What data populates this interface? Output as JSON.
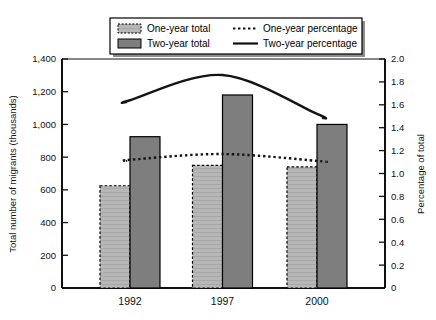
{
  "chart_data": {
    "type": "bar",
    "title": "",
    "subtitle": "",
    "categories": [
      "1992",
      "1997",
      "2000"
    ],
    "xlabel": "",
    "ylabel": "Total number of migrants (thousands)",
    "y2label": "Percentage of total",
    "ylim": [
      0,
      1400
    ],
    "y2lim": [
      0,
      2.0
    ],
    "ytick_labels": [
      "0",
      "200",
      "400",
      "600",
      "800",
      "1,000",
      "1,200",
      "1,400"
    ],
    "ytick_values": [
      0,
      200,
      400,
      600,
      800,
      1000,
      1200,
      1400
    ],
    "y2tick_labels": [
      "0",
      "0.2",
      "0.4",
      "0.6",
      "0.8",
      "1.0",
      "1.2",
      "1.4",
      "1.6",
      "1.8",
      "2.0"
    ],
    "y2tick_values": [
      0,
      0.2,
      0.4,
      0.6,
      0.8,
      1.0,
      1.2,
      1.4,
      1.6,
      1.8,
      2.0
    ],
    "grid": false,
    "legend_position": "top",
    "series": [
      {
        "name": "One-year total",
        "kind": "bar",
        "axis": "left",
        "color": "#b4b4b4",
        "edge": "dashed",
        "values": [
          625,
          750,
          740
        ]
      },
      {
        "name": "Two-year total",
        "kind": "bar",
        "axis": "left",
        "color": "#7e7e7e",
        "edge": "solid",
        "values": [
          925,
          1180,
          1000
        ]
      },
      {
        "name": "One-year percentage",
        "kind": "line",
        "axis": "right",
        "style": "dotted",
        "color": "#1a1a1a",
        "values": [
          1.12,
          1.17,
          1.11
        ]
      },
      {
        "name": "Two-year percentage",
        "kind": "line",
        "axis": "right",
        "style": "solid",
        "color": "#1a1a1a",
        "values": [
          1.64,
          1.86,
          1.52
        ]
      }
    ]
  },
  "legend": {
    "items": [
      {
        "label": "One-year total",
        "swatch": "hatched-light-gray"
      },
      {
        "label": "One-year percentage",
        "swatch": "dotted-line"
      },
      {
        "label": "Two-year total",
        "swatch": "solid-dark-gray"
      },
      {
        "label": "Two-year percentage",
        "swatch": "solid-line"
      }
    ]
  },
  "axes": {
    "left_title": "Total number of migrants (thousands)",
    "right_title": "Percentage of total"
  }
}
